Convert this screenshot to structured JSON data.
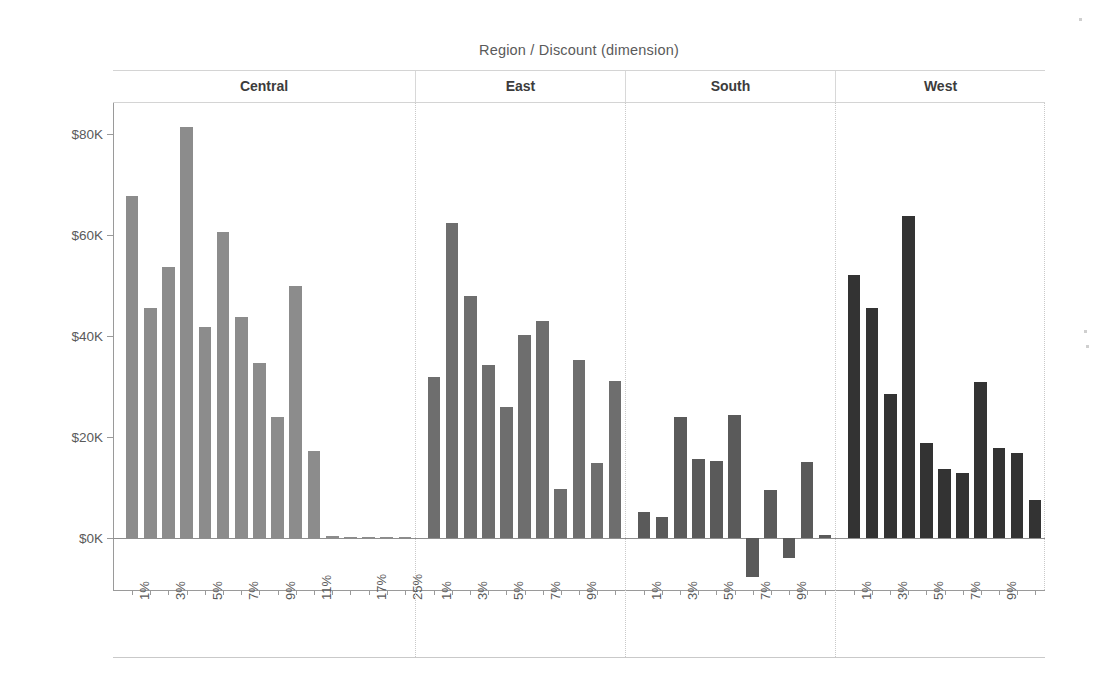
{
  "chart_data": {
    "type": "bar",
    "title": "Region / Discount (dimension)",
    "xlabel": "",
    "ylabel": "Profit",
    "ylim": [
      -12000,
      88000
    ],
    "y_ticks": [
      0,
      20000,
      40000,
      60000,
      80000
    ],
    "y_tick_labels": [
      "$0K",
      "$20K",
      "$40K",
      "$60K",
      "$80K"
    ],
    "grid": false,
    "legend": "none",
    "panel_variable": "Region",
    "category_variable": "Discount",
    "panels": [
      {
        "name": "Central",
        "color": "#8c8c8c",
        "categories": [
          "1%",
          "2%",
          "3%",
          "4%",
          "5%",
          "6%",
          "7%",
          "8%",
          "9%",
          "10%",
          "11%",
          "13%",
          "15%",
          "17%",
          "20%",
          "25%"
        ],
        "tick_labels": [
          "1%",
          "3%",
          "5%",
          "7%",
          "9%",
          "11%",
          "17%",
          "25%"
        ],
        "values": [
          67800,
          45600,
          53700,
          81400,
          41700,
          60500,
          43800,
          34600,
          23900,
          49900,
          17300,
          300,
          200,
          250,
          200,
          150
        ]
      },
      {
        "name": "East",
        "color": "#6e6e6e",
        "categories": [
          "1%",
          "2%",
          "3%",
          "4%",
          "5%",
          "6%",
          "7%",
          "8%",
          "9%",
          "10%",
          "11%"
        ],
        "tick_labels": [
          "1%",
          "3%",
          "5%",
          "7%",
          "9%"
        ],
        "values": [
          31800,
          62300,
          48000,
          34300,
          25900,
          40200,
          43000,
          9700,
          35200,
          14800,
          31000
        ]
      },
      {
        "name": "South",
        "color": "#5a5a5a",
        "categories": [
          "1%",
          "2%",
          "3%",
          "4%",
          "5%",
          "6%",
          "7%",
          "8%",
          "9%",
          "10%",
          "11%"
        ],
        "tick_labels": [
          "1%",
          "3%",
          "5%",
          "7%",
          "9%"
        ],
        "values": [
          5100,
          4200,
          24000,
          15700,
          15200,
          24300,
          -7800,
          9500,
          -3900,
          15100,
          500
        ]
      },
      {
        "name": "West",
        "color": "#333333",
        "categories": [
          "1%",
          "2%",
          "3%",
          "4%",
          "5%",
          "6%",
          "7%",
          "8%",
          "9%",
          "10%",
          "11%"
        ],
        "tick_labels": [
          "1%",
          "3%",
          "5%",
          "7%",
          "9%"
        ],
        "values": [
          52100,
          45600,
          28600,
          63700,
          18800,
          13600,
          12800,
          30900,
          17900,
          16800,
          7500
        ]
      }
    ]
  }
}
